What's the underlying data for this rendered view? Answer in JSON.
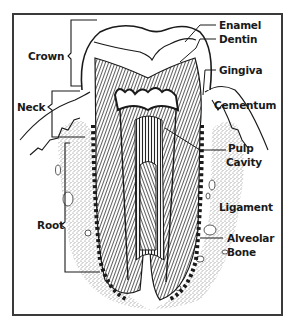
{
  "diagram": {
    "colors": {
      "background": "#ffffff",
      "line": "#1a1a1a",
      "frame": "#3a3a3a",
      "bone_stipple": "#8a8a8a"
    },
    "left_labels": [
      {
        "id": "crown",
        "text": "Crown"
      },
      {
        "id": "neck",
        "text": "Neck"
      },
      {
        "id": "root",
        "text": "Root"
      }
    ],
    "right_labels": [
      {
        "id": "enamel",
        "text": "Enamel"
      },
      {
        "id": "dentin",
        "text": "Dentin"
      },
      {
        "id": "gingiva",
        "text": "Gingiva"
      },
      {
        "id": "cementum",
        "text": "Cementum"
      },
      {
        "id": "pulp-cavity-1",
        "text": "Pulp"
      },
      {
        "id": "pulp-cavity-2",
        "text": "Cavity"
      },
      {
        "id": "ligament",
        "text": "Ligament"
      },
      {
        "id": "alveolar-bone-1",
        "text": "Alveolar"
      },
      {
        "id": "alveolar-bone-2",
        "text": "Bone"
      }
    ]
  }
}
